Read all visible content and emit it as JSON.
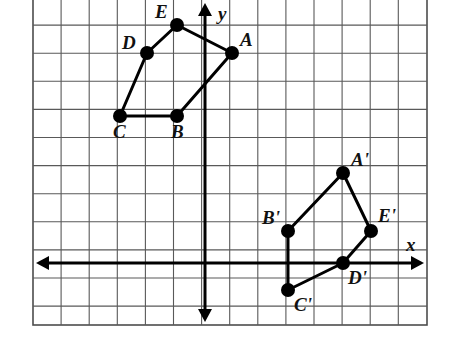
{
  "figure": {
    "background_color": "#ffffff",
    "grid": {
      "line_color": "#595959",
      "border_color": "#4d4d4d",
      "cell_size_px": 28.1,
      "left_px": 33,
      "top_px": -3,
      "right_px": 427,
      "bottom_px": 325,
      "columns": 14,
      "rows": 12,
      "show_grid": true
    },
    "axes": {
      "stroke_color": "#000000",
      "stroke_width": 3,
      "origin_px": {
        "x": 205,
        "y": 263
      },
      "x_axis": {
        "label": "x",
        "label_x_px": 406,
        "label_y_px": 235,
        "y_px": 263,
        "x_start_px": 36,
        "x_end_px": 424
      },
      "y_axis": {
        "label": "y",
        "label_x_px": 218,
        "label_y_px": 4,
        "x_px": 205,
        "y_start_px": 3,
        "y_end_px": 322
      }
    },
    "shape_style": {
      "edge_color": "#000000",
      "edge_width": 3,
      "vertex_color": "#000000",
      "vertex_radius_px": 7
    }
  },
  "chart_data": {
    "type": "scatter",
    "xlabel": "x",
    "ylabel": "y",
    "grid": true,
    "legend": "none",
    "xlim": [
      -6.1,
      7.9
    ],
    "ylim": [
      -2.2,
      9.5
    ],
    "series": [
      {
        "name": "Pentagon ABCDE",
        "closed": true,
        "points": [
          {
            "label": "A",
            "x": 1,
            "y": 7.5,
            "px": 232,
            "py": 53,
            "label_px": 240,
            "label_py": 30
          },
          {
            "label": "B",
            "x": -1,
            "y": 5.25,
            "px": 177,
            "py": 116,
            "label_px": 171,
            "label_py": 122
          },
          {
            "label": "C",
            "x": -3,
            "y": 5.25,
            "px": 120,
            "py": 116,
            "label_px": 113,
            "label_py": 122
          },
          {
            "label": "D",
            "x": -2,
            "y": 7.5,
            "px": 147,
            "py": 53,
            "label_px": 122,
            "label_py": 33
          },
          {
            "label": "E",
            "x": -1,
            "y": 8.5,
            "px": 177,
            "py": 25,
            "label_px": 155,
            "label_py": 2
          }
        ]
      },
      {
        "name": "Pentagon A'B'C'D'E'",
        "closed": true,
        "points": [
          {
            "label": "A'",
            "x": 5,
            "y": 3.25,
            "px": 343,
            "py": 173,
            "label_px": 351,
            "label_py": 150
          },
          {
            "label": "B'",
            "x": 3,
            "y": 1.15,
            "px": 288,
            "py": 231,
            "label_px": 262,
            "label_py": 208
          },
          {
            "label": "C'",
            "x": 3,
            "y": -1,
            "px": 288,
            "py": 290,
            "label_px": 294,
            "label_py": 295
          },
          {
            "label": "D'",
            "x": 5,
            "y": 0,
            "px": 343,
            "py": 263,
            "label_px": 348,
            "label_py": 268
          },
          {
            "label": "E'",
            "x": 6,
            "y": 1.15,
            "px": 371,
            "py": 231,
            "label_px": 378,
            "label_py": 206
          }
        ]
      }
    ]
  }
}
